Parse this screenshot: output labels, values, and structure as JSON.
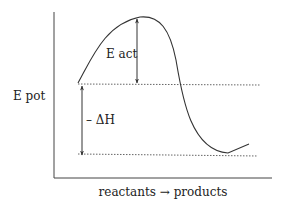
{
  "diagram": {
    "y_axis_label": "E pot",
    "x_axis_label": "reactants → products",
    "activation_label": "E act",
    "enthalpy_label": "– ΔH",
    "colors": {
      "line": "#333333",
      "dotted": "#666666",
      "text": "#222222"
    }
  }
}
